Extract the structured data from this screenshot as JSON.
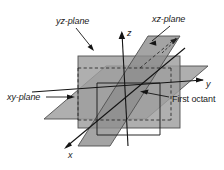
{
  "figure": {
    "background_color": "#ffffff",
    "line_color": "#1a1a1a",
    "labels": {
      "yz_plane": "yz-plane",
      "xz_plane": "xz-plane",
      "xy_plane": "xy-plane",
      "first_octant": "First octant",
      "axis_x": "x",
      "axis_y": "y",
      "axis_z": "z"
    },
    "colors": {
      "yz_plane_fill": "#9a9a9a",
      "xz_plane_fill": "#8a8a8a",
      "xy_plane_fill": "#a8a8a8",
      "plane_stroke": "#4a4a4a",
      "axis_stroke": "#1a1a1a",
      "dashed_stroke": "#2a2a2a",
      "leader_stroke": "#1a1a1a"
    },
    "geometry": {
      "yz_plane_rect": {
        "x": 78,
        "y": 56,
        "width": 102,
        "height": 72
      },
      "xz_plane_points": "148,36 180,36 110,146 78,146",
      "xy_plane_points": "44,119 106,66 208,66 146,119",
      "origin": {
        "x": 128,
        "y": 92
      },
      "axis_y_tip": {
        "x": 204,
        "y": 80
      },
      "axis_z_tip": {
        "x": 122,
        "y": 31
      },
      "axis_x_tip": {
        "x": 64,
        "y": 148
      }
    }
  }
}
